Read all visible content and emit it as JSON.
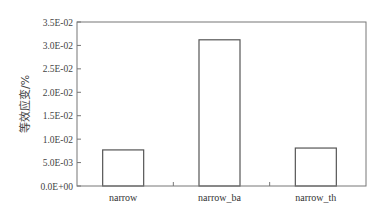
{
  "chart_data": {
    "type": "bar",
    "title": "",
    "xlabel": "",
    "ylabel": "等效应变/%",
    "categories": [
      "narrow",
      "narrow_ba",
      "narrow_th"
    ],
    "values": [
      0.0077,
      0.0312,
      0.0081
    ],
    "ylim": [
      0,
      0.035
    ],
    "yticks": [
      0,
      0.005,
      0.01,
      0.015,
      0.02,
      0.025,
      0.03,
      0.035
    ],
    "ytick_labels": [
      "0.0E+00",
      "5.0E-03",
      "1.0E-02",
      "1.5E-02",
      "2.0E-02",
      "2.5E-02",
      "3.0E-02",
      "3.5E-02"
    ],
    "grid": false,
    "legend": null,
    "bar_fill": "#ffffff",
    "bar_edge": "#555555"
  }
}
